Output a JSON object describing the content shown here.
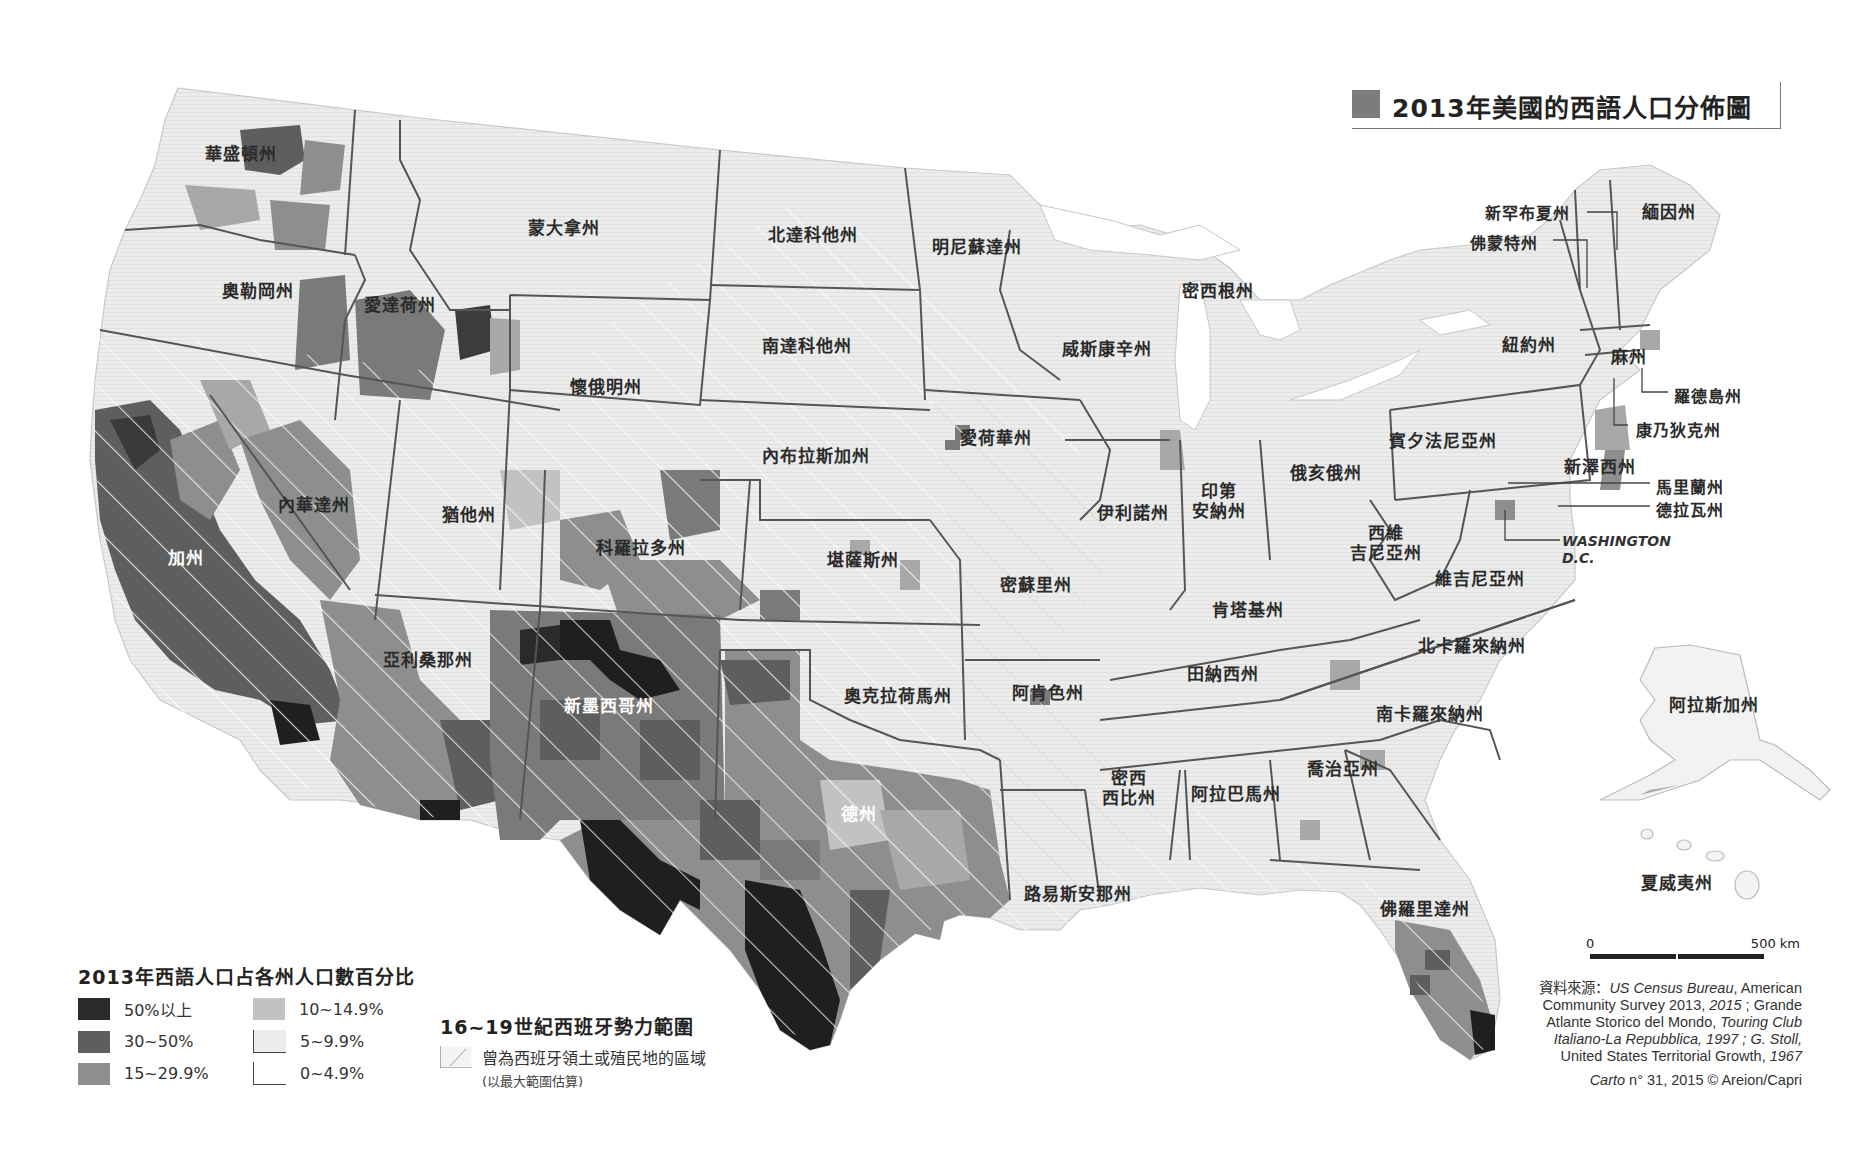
{
  "title": "2013年美國的西語人口分佈圖",
  "legend": {
    "title": "2013年西語人口占各州人口數百分比",
    "classes": [
      {
        "label": "50%以上",
        "color": "#2a2a2a"
      },
      {
        "label": "10~14.9%",
        "color": "#c2c2c2"
      },
      {
        "label": "30~50%",
        "color": "#5e5e5e"
      },
      {
        "label": "5~9.9%",
        "color": "#e6e6e6"
      },
      {
        "label": "15~29.9%",
        "color": "#8e8e8e"
      },
      {
        "label": "0~4.9%",
        "color": "#ffffff"
      }
    ]
  },
  "spanish_influence": {
    "title": "16~19世紀西班牙勢力範圍",
    "item": "曾為西班牙領土或殖民地的區域",
    "note": "(以最大範圍估算)"
  },
  "scale": {
    "start": "0",
    "end": "500 km"
  },
  "source": {
    "prefix": "資料來源：",
    "line1_italic": "US Census Bureau",
    "line1_rest": ", American",
    "line2": "Community Survey 2013, ",
    "line2_italic": "2015",
    "line2_rest": " ; Grande",
    "line3": "Atlante Storico del Mondo, ",
    "line3_italic": "Touring Club",
    "line4_italic": "Italiano-La Repubblica, 1997 ; G. Stoll,",
    "line5": "United States Territorial Growth, ",
    "line5_italic": "1967"
  },
  "credit": {
    "italic": "Carto",
    "rest": " n° 31, 2015 © Areion/Capri"
  },
  "states": {
    "washington": "華盛頓州",
    "oregon": "奧勒岡州",
    "idaho": "愛達荷州",
    "montana": "蒙大拿州",
    "wyoming": "懷俄明州",
    "north_dakota": "北達科他州",
    "south_dakota": "南達科他州",
    "minnesota": "明尼蘇達州",
    "wisconsin": "威斯康辛州",
    "michigan": "密西根州",
    "nebraska": "內布拉斯加州",
    "iowa": "愛荷華州",
    "illinois": "伊利諾州",
    "indiana_1": "印第",
    "indiana_2": "安納州",
    "ohio": "俄亥俄州",
    "pennsylvania": "賓夕法尼亞州",
    "new_york": "紐約州",
    "nevada": "內華達州",
    "utah": "猶他州",
    "colorado": "科羅拉多州",
    "kansas": "堪薩斯州",
    "missouri": "密蘇里州",
    "california": "加州",
    "arizona": "亞利桑那州",
    "new_mexico": "新墨西哥州",
    "oklahoma": "奧克拉荷馬州",
    "arkansas": "阿肯色州",
    "texas": "德州",
    "louisiana": "路易斯安那州",
    "mississippi_1": "密西",
    "mississippi_2": "西比州",
    "alabama": "阿拉巴馬州",
    "georgia": "喬治亞州",
    "florida": "佛羅里達州",
    "tennessee": "田納西州",
    "kentucky": "肯塔基州",
    "west_virginia_1": "西維",
    "west_virginia_2": "吉尼亞州",
    "virginia": "維吉尼亞州",
    "north_carolina": "北卡羅來納州",
    "south_carolina": "南卡羅來納州",
    "maine": "緬因州",
    "new_hampshire": "新罕布夏州",
    "vermont": "佛蒙特州",
    "massachusetts": "麻州",
    "rhode_island": "羅德島州",
    "connecticut": "康乃狄克州",
    "new_jersey": "新澤西州",
    "maryland": "馬里蘭州",
    "delaware": "德拉瓦州",
    "dc_1": "WASHINGTON",
    "dc_2": "D.C.",
    "alaska": "阿拉斯加州",
    "hawaii": "夏威夷州"
  }
}
